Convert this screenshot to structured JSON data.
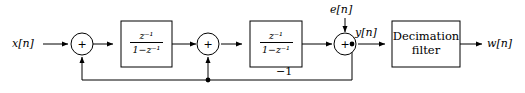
{
  "diagram": {
    "type": "block-diagram",
    "width": 525,
    "height": 93,
    "line_color": "#000000",
    "background": "#ffffff"
  },
  "signals": {
    "input": "x[n]",
    "noise": "e[n]",
    "modulator_output": "y[n]",
    "output": "w[n]",
    "feedback_gain": "−1"
  },
  "adders": {
    "sign": "+",
    "first_label": "+",
    "second_label": "+",
    "third_label": "+"
  },
  "blocks": {
    "integrator1": {
      "numerator": "z⁻¹",
      "denominator": "1−z⁻¹"
    },
    "integrator2": {
      "numerator": "z⁻¹",
      "denominator": "1−z⁻¹"
    },
    "decimation": {
      "line1": "Decimation",
      "line2": "filter"
    }
  }
}
